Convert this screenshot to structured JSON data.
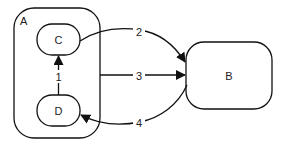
{
  "diagram": {
    "nodes": {
      "A": {
        "label": "A"
      },
      "B": {
        "label": "B"
      },
      "C": {
        "label": "C"
      },
      "D": {
        "label": "D"
      }
    },
    "edges": [
      {
        "id": "1",
        "label": "1",
        "from": "D",
        "to": "C"
      },
      {
        "id": "2",
        "label": "2",
        "from": "C",
        "to": "B"
      },
      {
        "id": "3",
        "label": "3",
        "from": "A",
        "to": "B"
      },
      {
        "id": "4",
        "label": "4",
        "from": "B",
        "to": "D"
      }
    ]
  }
}
